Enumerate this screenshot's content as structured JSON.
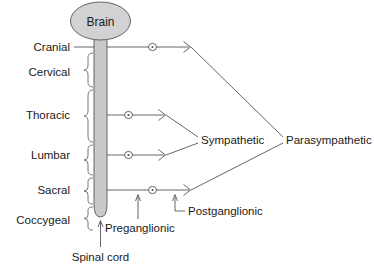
{
  "diagram": {
    "title_text": "Brain",
    "spinal_cord_label": "Spinal cord",
    "preganglionic_label": "Preganglionic",
    "postganglionic_label": "Postganglionic",
    "sympathetic_label": "Sympathetic",
    "parasympathetic_label": "Parasympathetic",
    "segments": [
      {
        "id": "cranial",
        "label": "Cranial",
        "y": 47
      },
      {
        "id": "cervical",
        "label": "Cervical",
        "y": 72
      },
      {
        "id": "thoracic",
        "label": "Thoracic",
        "y": 115
      },
      {
        "id": "lumbar",
        "label": "Lumbar",
        "y": 155
      },
      {
        "id": "sacral",
        "label": "Sacral",
        "y": 190
      },
      {
        "id": "coccygeal",
        "label": "Coccygeal",
        "y": 220
      }
    ],
    "nerve_rows": [
      {
        "id": "cranial-nerve",
        "y": 47,
        "ganglion_x": 152,
        "arrow_x": 190,
        "division": "parasympathetic"
      },
      {
        "id": "thoracic-nerve",
        "y": 115,
        "ganglion_x": 128,
        "arrow_x": 165,
        "division": "sympathetic"
      },
      {
        "id": "lumbar-nerve",
        "y": 155,
        "ganglion_x": 128,
        "arrow_x": 165,
        "division": "sympathetic"
      },
      {
        "id": "sacral-nerve",
        "y": 190,
        "ganglion_x": 152,
        "arrow_x": 190,
        "division": "parasympathetic"
      }
    ],
    "colors": {
      "brain_fill": "#d2d2d4",
      "cord_fill": "#c9c9cb",
      "outline": "#55555a",
      "text": "#1a1a1a",
      "background": "#ffffff"
    }
  }
}
